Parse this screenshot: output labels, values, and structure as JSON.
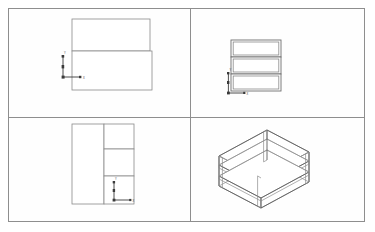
{
  "document": {
    "title": "Shelf Unit — Orthographic and Isometric Views",
    "sheet_border_color": "#8e8e8e",
    "line_color": "#8a8a8a",
    "background": "#ffffff"
  },
  "layout": {
    "viewport_count": 4,
    "columns": 2,
    "rows": 2,
    "divider_x": 190,
    "divider_y": 117
  },
  "viewports": [
    {
      "id": "top-left",
      "name": "Top View",
      "projection": "top",
      "shapes": [
        {
          "kind": "rectangle",
          "name": "plan-upper-panel",
          "x": 22,
          "y": 10,
          "w": 78,
          "h": 32
        },
        {
          "kind": "rectangle",
          "name": "plan-lower-panel",
          "x": 22,
          "y": 42,
          "w": 80,
          "h": 39
        }
      ],
      "ucs_marker": {
        "visible": true,
        "x": 24,
        "y": 66,
        "x_label": "X",
        "y_label": "Y"
      }
    },
    {
      "id": "top-right",
      "name": "Front View",
      "projection": "front",
      "shelf_count": 3,
      "shapes": [
        {
          "kind": "shelf-box",
          "name": "front-shelf-top",
          "x": 40,
          "y": 31,
          "w": 50,
          "h": 17
        },
        {
          "kind": "shelf-box",
          "name": "front-shelf-middle",
          "x": 40,
          "y": 48,
          "w": 50,
          "h": 17
        },
        {
          "kind": "shelf-box",
          "name": "front-shelf-bottom",
          "x": 40,
          "y": 65,
          "w": 50,
          "h": 17
        }
      ],
      "ucs_marker": {
        "visible": true,
        "x": 38,
        "y": 80,
        "x_label": "X",
        "y_label": "Y"
      }
    },
    {
      "id": "bottom-left",
      "name": "Side View",
      "projection": "side",
      "shapes": [
        {
          "kind": "rectangle",
          "name": "side-tall-panel",
          "x": 63,
          "y": 6,
          "w": 32,
          "h": 80
        },
        {
          "kind": "rectangle",
          "name": "side-shelf-top",
          "x": 95,
          "y": 6,
          "w": 30,
          "h": 25
        },
        {
          "kind": "rectangle",
          "name": "side-shelf-middle",
          "x": 95,
          "y": 31,
          "w": 30,
          "h": 27
        },
        {
          "kind": "rectangle",
          "name": "side-shelf-bottom",
          "x": 95,
          "y": 58,
          "w": 30,
          "h": 28
        }
      ],
      "ucs_marker": {
        "visible": true,
        "x": 106,
        "y": 78,
        "x_label": "X",
        "y_label": "Y"
      }
    },
    {
      "id": "bottom-right",
      "name": "Isometric View",
      "projection": "isometric",
      "shelf_count": 3,
      "description": "Wireframe isometric of a three-tier open shelf unit",
      "ucs_marker": {
        "visible": false
      }
    }
  ],
  "labels": {
    "axis_x": "X",
    "axis_y": "Y"
  }
}
